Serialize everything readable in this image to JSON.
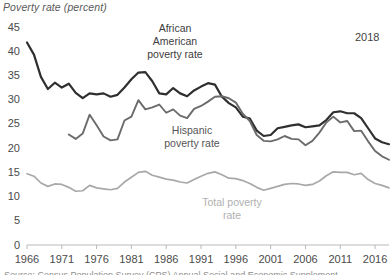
{
  "axis_title": "Poverty rate (percent)",
  "year_note": "2018",
  "source_note": "Source: Census Population Survey (CPS) Annual Social and Economic Supplement",
  "annotations": {
    "african_american": "African\nAmerican\npoverty rate",
    "african_american_lines": [
      "African",
      "American",
      "poverty rate"
    ],
    "hispanic_lines": [
      "Hispanic",
      "poverty rate"
    ],
    "total_lines": [
      "Total poverty",
      "rate"
    ]
  },
  "colors": {
    "african_american": "#2f2f2f",
    "hispanic": "#6b6b6b",
    "total": "#a8a8a8",
    "axis": "#b9b9b9",
    "text": "#4a4a4a",
    "background": "#ffffff"
  },
  "chart_data": {
    "type": "line",
    "title": "Poverty rate (percent)",
    "xlabel": "",
    "ylabel": "Poverty rate (percent)",
    "ylim": [
      0,
      45
    ],
    "xlim": [
      1966,
      2018
    ],
    "grid": false,
    "legend": "inline-annotations",
    "ytick_labels": [
      "0",
      "5",
      "10",
      "15",
      "20",
      "25",
      "30",
      "35",
      "40",
      "45"
    ],
    "ytick_values": [
      0,
      5,
      10,
      15,
      20,
      25,
      30,
      35,
      40,
      45
    ],
    "xtick_labels": [
      "1966",
      "1971",
      "1976",
      "1981",
      "1986",
      "1991",
      "1996",
      "2001",
      "2006",
      "2011",
      "2016"
    ],
    "xtick_values": [
      1966,
      1971,
      1976,
      1981,
      1986,
      1991,
      1996,
      2001,
      2006,
      2011,
      2016
    ],
    "series": [
      {
        "name": "African American poverty rate",
        "color": "#2f2f2f",
        "x": [
          1966,
          1967,
          1968,
          1969,
          1970,
          1971,
          1972,
          1973,
          1974,
          1975,
          1976,
          1977,
          1978,
          1979,
          1980,
          1981,
          1982,
          1983,
          1984,
          1985,
          1986,
          1987,
          1988,
          1989,
          1990,
          1991,
          1992,
          1993,
          1994,
          1995,
          1996,
          1997,
          1998,
          1999,
          2000,
          2001,
          2002,
          2003,
          2004,
          2005,
          2006,
          2007,
          2008,
          2009,
          2010,
          2011,
          2012,
          2013,
          2014,
          2015,
          2016,
          2017,
          2018
        ],
        "values": [
          41.8,
          39.3,
          34.7,
          32.2,
          33.5,
          32.5,
          33.3,
          31.4,
          30.3,
          31.3,
          31.1,
          31.3,
          30.6,
          31.0,
          32.5,
          34.2,
          35.6,
          35.7,
          33.8,
          31.3,
          31.1,
          32.4,
          31.3,
          30.7,
          31.9,
          32.7,
          33.4,
          33.1,
          30.6,
          29.3,
          28.4,
          26.5,
          26.1,
          23.6,
          22.5,
          22.7,
          24.1,
          24.4,
          24.7,
          24.9,
          24.3,
          24.5,
          24.7,
          25.8,
          27.4,
          27.6,
          27.2,
          27.2,
          26.2,
          24.1,
          22.0,
          21.2,
          20.8
        ]
      },
      {
        "name": "Hispanic poverty rate",
        "color": "#6b6b6b",
        "x": [
          1972,
          1973,
          1974,
          1975,
          1976,
          1977,
          1978,
          1979,
          1980,
          1981,
          1982,
          1983,
          1984,
          1985,
          1986,
          1987,
          1988,
          1989,
          1990,
          1991,
          1992,
          1993,
          1994,
          1995,
          1996,
          1997,
          1998,
          1999,
          2000,
          2001,
          2002,
          2003,
          2004,
          2005,
          2006,
          2007,
          2008,
          2009,
          2010,
          2011,
          2012,
          2013,
          2014,
          2015,
          2016,
          2017,
          2018
        ],
        "values": [
          22.8,
          21.9,
          23.0,
          26.9,
          24.7,
          22.4,
          21.6,
          21.8,
          25.7,
          26.5,
          29.9,
          28.0,
          28.4,
          29.0,
          27.3,
          28.0,
          26.7,
          26.2,
          28.1,
          28.7,
          29.6,
          30.6,
          30.7,
          30.3,
          29.4,
          27.1,
          25.6,
          22.7,
          21.5,
          21.4,
          21.8,
          22.5,
          21.9,
          21.8,
          20.6,
          21.5,
          23.2,
          25.3,
          26.5,
          25.3,
          25.6,
          23.5,
          23.6,
          21.4,
          19.4,
          18.3,
          17.6
        ]
      },
      {
        "name": "Total poverty rate",
        "color": "#a8a8a8",
        "x": [
          1966,
          1967,
          1968,
          1969,
          1970,
          1971,
          1972,
          1973,
          1974,
          1975,
          1976,
          1977,
          1978,
          1979,
          1980,
          1981,
          1982,
          1983,
          1984,
          1985,
          1986,
          1987,
          1988,
          1989,
          1990,
          1991,
          1992,
          1993,
          1994,
          1995,
          1996,
          1997,
          1998,
          1999,
          2000,
          2001,
          2002,
          2003,
          2004,
          2005,
          2006,
          2007,
          2008,
          2009,
          2010,
          2011,
          2012,
          2013,
          2014,
          2015,
          2016,
          2017,
          2018
        ],
        "values": [
          14.7,
          14.2,
          12.8,
          12.1,
          12.6,
          12.5,
          11.9,
          11.1,
          11.2,
          12.3,
          11.8,
          11.6,
          11.4,
          11.7,
          13.0,
          14.0,
          15.0,
          15.2,
          14.4,
          14.0,
          13.6,
          13.4,
          13.0,
          12.8,
          13.5,
          14.2,
          14.8,
          15.1,
          14.5,
          13.8,
          13.7,
          13.3,
          12.7,
          11.9,
          11.3,
          11.7,
          12.1,
          12.5,
          12.7,
          12.6,
          12.3,
          12.5,
          13.2,
          14.3,
          15.1,
          15.0,
          15.0,
          14.5,
          14.8,
          13.5,
          12.7,
          12.3,
          11.8
        ]
      }
    ]
  }
}
